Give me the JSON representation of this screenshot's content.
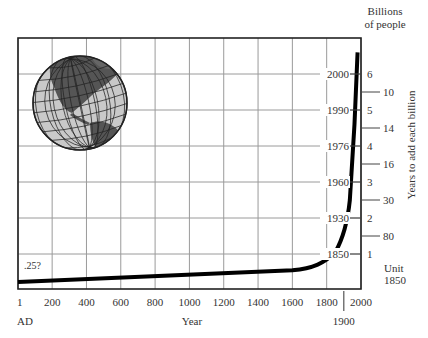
{
  "chart_data": {
    "type": "line",
    "title": "",
    "xlabel": "Year",
    "ylabel_left": "",
    "ylabel_right_top": [
      "Billions",
      "of people"
    ],
    "ylabel_right_side": "Years to add each billion",
    "x_tick_labels": [
      "1",
      "200",
      "400",
      "600",
      "800",
      "1000",
      "1200",
      "1400",
      "1600",
      "1800",
      "2000"
    ],
    "x_tick_values": [
      1,
      200,
      400,
      600,
      800,
      1000,
      1200,
      1400,
      1600,
      1800,
      2000
    ],
    "x_sub_labels": {
      "start": "AD",
      "extra_tick": "1900"
    },
    "xlim": [
      1,
      2000
    ],
    "ylim": [
      0,
      6.5
    ],
    "grid": true,
    "billions_ticks": [
      1,
      2,
      3,
      4,
      5,
      6
    ],
    "billion_year_labels": [
      {
        "billions": 1,
        "year": "1850"
      },
      {
        "billions": 2,
        "year": "1930"
      },
      {
        "billions": 3,
        "year": "1960"
      },
      {
        "billions": 4,
        "year": "1976"
      },
      {
        "billions": 5,
        "year": "1990"
      },
      {
        "billions": 6,
        "year": "2000"
      }
    ],
    "years_to_add_each_billion": [
      {
        "between": [
          0,
          1
        ],
        "label": "Unit\n1850",
        "years": "Unit 1850"
      },
      {
        "between": [
          1,
          2
        ],
        "years": "80"
      },
      {
        "between": [
          2,
          3
        ],
        "years": "30"
      },
      {
        "between": [
          3,
          4
        ],
        "years": "16"
      },
      {
        "between": [
          4,
          5
        ],
        "years": "14"
      },
      {
        "between": [
          5,
          6
        ],
        "years": "10"
      }
    ],
    "annotations": [
      {
        "text": ".25?",
        "x": 1,
        "y": 0.25
      }
    ],
    "series": [
      {
        "name": "World population (billions)",
        "x": [
          1,
          200,
          400,
          600,
          800,
          1000,
          1200,
          1400,
          1600,
          1700,
          1750,
          1800,
          1850,
          1900,
          1930,
          1960,
          1976,
          1990,
          2000,
          2010
        ],
        "values": [
          0.25,
          0.3,
          0.35,
          0.4,
          0.45,
          0.5,
          0.55,
          0.6,
          0.65,
          0.7,
          0.8,
          0.95,
          1.0,
          1.6,
          2.0,
          3.0,
          4.0,
          5.0,
          6.0,
          6.6
        ]
      }
    ],
    "decoration": "globe-illustration-americas"
  },
  "labels": {
    "billions_title_1": "Billions",
    "billions_title_2": "of people",
    "years_side": "Years to add each billion",
    "x_axis_title": "Year",
    "ad": "AD",
    "x_extra": "1900",
    "start_note": ".25?",
    "unit_1": "Unit",
    "unit_2": "1850"
  }
}
